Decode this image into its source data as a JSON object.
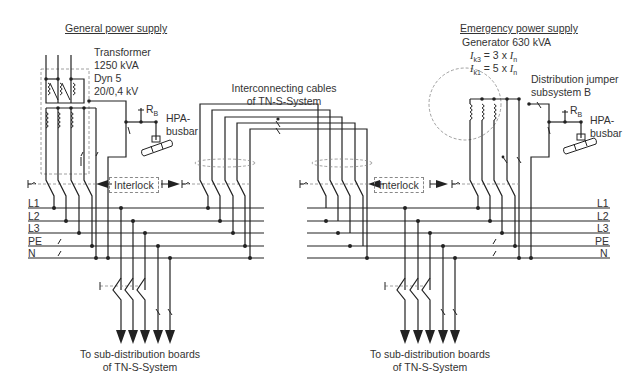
{
  "general": {
    "title": "General power supply",
    "transformer": [
      "Transformer",
      "1250 kVA",
      "Dyn 5",
      "20/0,4 kV"
    ],
    "rb": "R",
    "rb_sub": "B",
    "hpa": [
      "HPA-",
      "busbar"
    ],
    "interlock": "Interlock",
    "output": [
      "To sub-distribution boards",
      "of TN-S-System"
    ]
  },
  "emergency": {
    "title": "Emergency power supply",
    "generator": "Generator 630 kVA",
    "ik3": {
      "sym": "I",
      "sub": "k3",
      "eq": " = 3 x ",
      "sym2": "I",
      "sub2": "n"
    },
    "ik1": {
      "sym": "I",
      "sub": "k1",
      "eq": " = 5 x ",
      "sym2": "I",
      "sub2": "n"
    },
    "jumper": [
      "Distribution jumper",
      "subsystem B"
    ],
    "rb": "R",
    "rb_sub": "B",
    "hpa": [
      "HPA-",
      "busbar"
    ],
    "interlock": "Interlock",
    "output": [
      "To sub-distribution boards",
      "of TN-S-System"
    ]
  },
  "interconnect": [
    "Interconnecting cables",
    "of TN-S-System"
  ],
  "busbars": {
    "left": [
      "L1",
      "L2",
      "L3",
      "PE",
      "N"
    ],
    "right": [
      "L1",
      "L2",
      "L3",
      "PE",
      "N"
    ]
  }
}
